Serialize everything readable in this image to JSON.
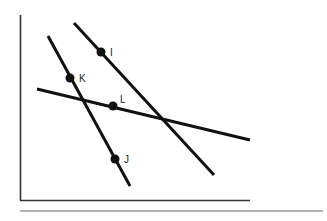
{
  "diagram": {
    "type": "geometry-lines",
    "frame": {
      "axis_color": "#333333",
      "separator_color": "#9a9a9a",
      "vertical_axis": {
        "x": 20.5,
        "y1": 15,
        "y2": 200.5
      },
      "horizontal_axis": {
        "y": 200.5,
        "x1": 20,
        "x2": 250
      },
      "separator": {
        "y": 211,
        "x1": 20,
        "x2": 323
      }
    },
    "line_color": "#111111",
    "lines": [
      {
        "name": "line-through-I",
        "x1": 74,
        "y1": 23,
        "x2": 214,
        "y2": 175
      },
      {
        "name": "line-through-K-J",
        "x1": 48,
        "y1": 36,
        "x2": 130,
        "y2": 186
      },
      {
        "name": "line-through-L",
        "x1": 37,
        "y1": 89,
        "x2": 250,
        "y2": 140
      }
    ],
    "points": [
      {
        "label": "I",
        "x": 101,
        "y": 52,
        "lx": 110,
        "ly": 56
      },
      {
        "label": "K",
        "x": 70,
        "y": 78,
        "lx": 79,
        "ly": 82
      },
      {
        "label": "L",
        "x": 113,
        "y": 106,
        "lx": 120,
        "ly": 103
      },
      {
        "label": "J",
        "x": 115,
        "y": 159,
        "lx": 124,
        "ly": 163
      }
    ]
  }
}
